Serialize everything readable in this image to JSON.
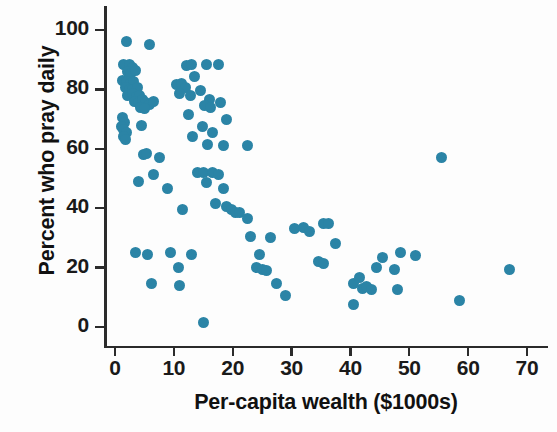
{
  "chart_data": {
    "type": "scatter",
    "title": "",
    "xlabel": "Per-capita wealth ($1000s)",
    "ylabel": "Percent who pray daily",
    "xlim": [
      -2,
      73.5
    ],
    "ylim": [
      -5,
      107
    ],
    "xticks": [
      0,
      10,
      20,
      30,
      40,
      50,
      60,
      70
    ],
    "xtick_labels": [
      "0",
      "10",
      "20",
      "30",
      "40",
      "50",
      "60",
      "70"
    ],
    "yticks": [
      0,
      20,
      40,
      60,
      80,
      100
    ],
    "ytick_labels": [
      "0",
      "20",
      "40",
      "60",
      "80",
      "100"
    ],
    "grid": false,
    "legend": null,
    "marker": {
      "shape": "circle",
      "color": "#2b84a6",
      "size": 11
    },
    "points": [
      [
        2.0,
        96.0
      ],
      [
        5.8,
        95.0
      ],
      [
        1.5,
        88.5
      ],
      [
        2.4,
        88.5
      ],
      [
        3.0,
        87.5
      ],
      [
        2.1,
        86.0
      ],
      [
        2.7,
        85.5
      ],
      [
        3.4,
        86.5
      ],
      [
        1.3,
        83.0
      ],
      [
        2.0,
        82.5
      ],
      [
        2.6,
        82.0
      ],
      [
        3.2,
        82.5
      ],
      [
        1.8,
        80.5
      ],
      [
        2.4,
        80.0
      ],
      [
        3.0,
        80.0
      ],
      [
        3.8,
        80.5
      ],
      [
        2.2,
        78.0
      ],
      [
        2.9,
        78.5
      ],
      [
        3.6,
        77.5
      ],
      [
        4.2,
        78.0
      ],
      [
        3.3,
        76.0
      ],
      [
        4.0,
        75.5
      ],
      [
        4.7,
        76.5
      ],
      [
        5.2,
        75.5
      ],
      [
        5.9,
        75.0
      ],
      [
        6.5,
        76.0
      ],
      [
        4.4,
        74.0
      ],
      [
        5.0,
        73.5
      ],
      [
        1.2,
        70.5
      ],
      [
        1.6,
        69.0
      ],
      [
        1.1,
        67.5
      ],
      [
        1.5,
        66.5
      ],
      [
        1.9,
        65.5
      ],
      [
        1.4,
        64.0
      ],
      [
        1.8,
        63.0
      ],
      [
        4.5,
        68.0
      ],
      [
        10.5,
        81.5
      ],
      [
        11.3,
        82.0
      ],
      [
        12.0,
        80.5
      ],
      [
        11.0,
        78.5
      ],
      [
        12.8,
        78.0
      ],
      [
        13.5,
        84.5
      ],
      [
        12.2,
        88.0
      ],
      [
        13.0,
        88.5
      ],
      [
        15.5,
        88.5
      ],
      [
        17.5,
        88.5
      ],
      [
        14.5,
        79.5
      ],
      [
        16.0,
        76.5
      ],
      [
        15.2,
        74.5
      ],
      [
        16.2,
        74.0
      ],
      [
        18.0,
        75.5
      ],
      [
        12.5,
        71.5
      ],
      [
        14.8,
        67.5
      ],
      [
        13.2,
        64.0
      ],
      [
        16.5,
        65.5
      ],
      [
        19.0,
        70.0
      ],
      [
        15.8,
        61.5
      ],
      [
        18.5,
        61.0
      ],
      [
        22.5,
        61.0
      ],
      [
        4.8,
        58.0
      ],
      [
        5.4,
        58.5
      ],
      [
        7.5,
        57.0
      ],
      [
        4.0,
        49.0
      ],
      [
        6.5,
        51.5
      ],
      [
        14.0,
        52.0
      ],
      [
        15.0,
        52.0
      ],
      [
        16.5,
        52.0
      ],
      [
        17.5,
        51.5
      ],
      [
        15.5,
        48.5
      ],
      [
        18.5,
        46.5
      ],
      [
        17.0,
        41.5
      ],
      [
        19.0,
        40.5
      ],
      [
        19.8,
        39.5
      ],
      [
        20.5,
        38.5
      ],
      [
        21.2,
        38.5
      ],
      [
        22.5,
        36.5
      ],
      [
        9.0,
        46.5
      ],
      [
        11.5,
        39.5
      ],
      [
        3.5,
        25.0
      ],
      [
        5.5,
        24.5
      ],
      [
        6.2,
        14.5
      ],
      [
        9.5,
        25.0
      ],
      [
        10.8,
        20.0
      ],
      [
        13.0,
        24.5
      ],
      [
        15.0,
        1.5
      ],
      [
        11.0,
        14.0
      ],
      [
        24.5,
        24.5
      ],
      [
        24.0,
        20.0
      ],
      [
        25.0,
        19.5
      ],
      [
        25.8,
        19.0
      ],
      [
        23.0,
        30.5
      ],
      [
        26.5,
        30.0
      ],
      [
        27.5,
        14.5
      ],
      [
        29.0,
        10.5
      ],
      [
        30.5,
        33.0
      ],
      [
        32.0,
        33.5
      ],
      [
        33.0,
        32.0
      ],
      [
        35.5,
        35.0
      ],
      [
        36.2,
        35.0
      ],
      [
        34.5,
        22.0
      ],
      [
        35.5,
        21.5
      ],
      [
        37.5,
        28.0
      ],
      [
        40.5,
        14.5
      ],
      [
        41.5,
        16.5
      ],
      [
        42.0,
        13.0
      ],
      [
        42.8,
        13.5
      ],
      [
        43.5,
        12.5
      ],
      [
        40.5,
        7.5
      ],
      [
        44.5,
        20.0
      ],
      [
        45.5,
        23.5
      ],
      [
        47.5,
        19.5
      ],
      [
        48.0,
        12.5
      ],
      [
        48.5,
        25.0
      ],
      [
        51.0,
        24.0
      ],
      [
        55.5,
        57.0
      ],
      [
        58.5,
        9.0
      ],
      [
        67.0,
        19.5
      ]
    ]
  }
}
